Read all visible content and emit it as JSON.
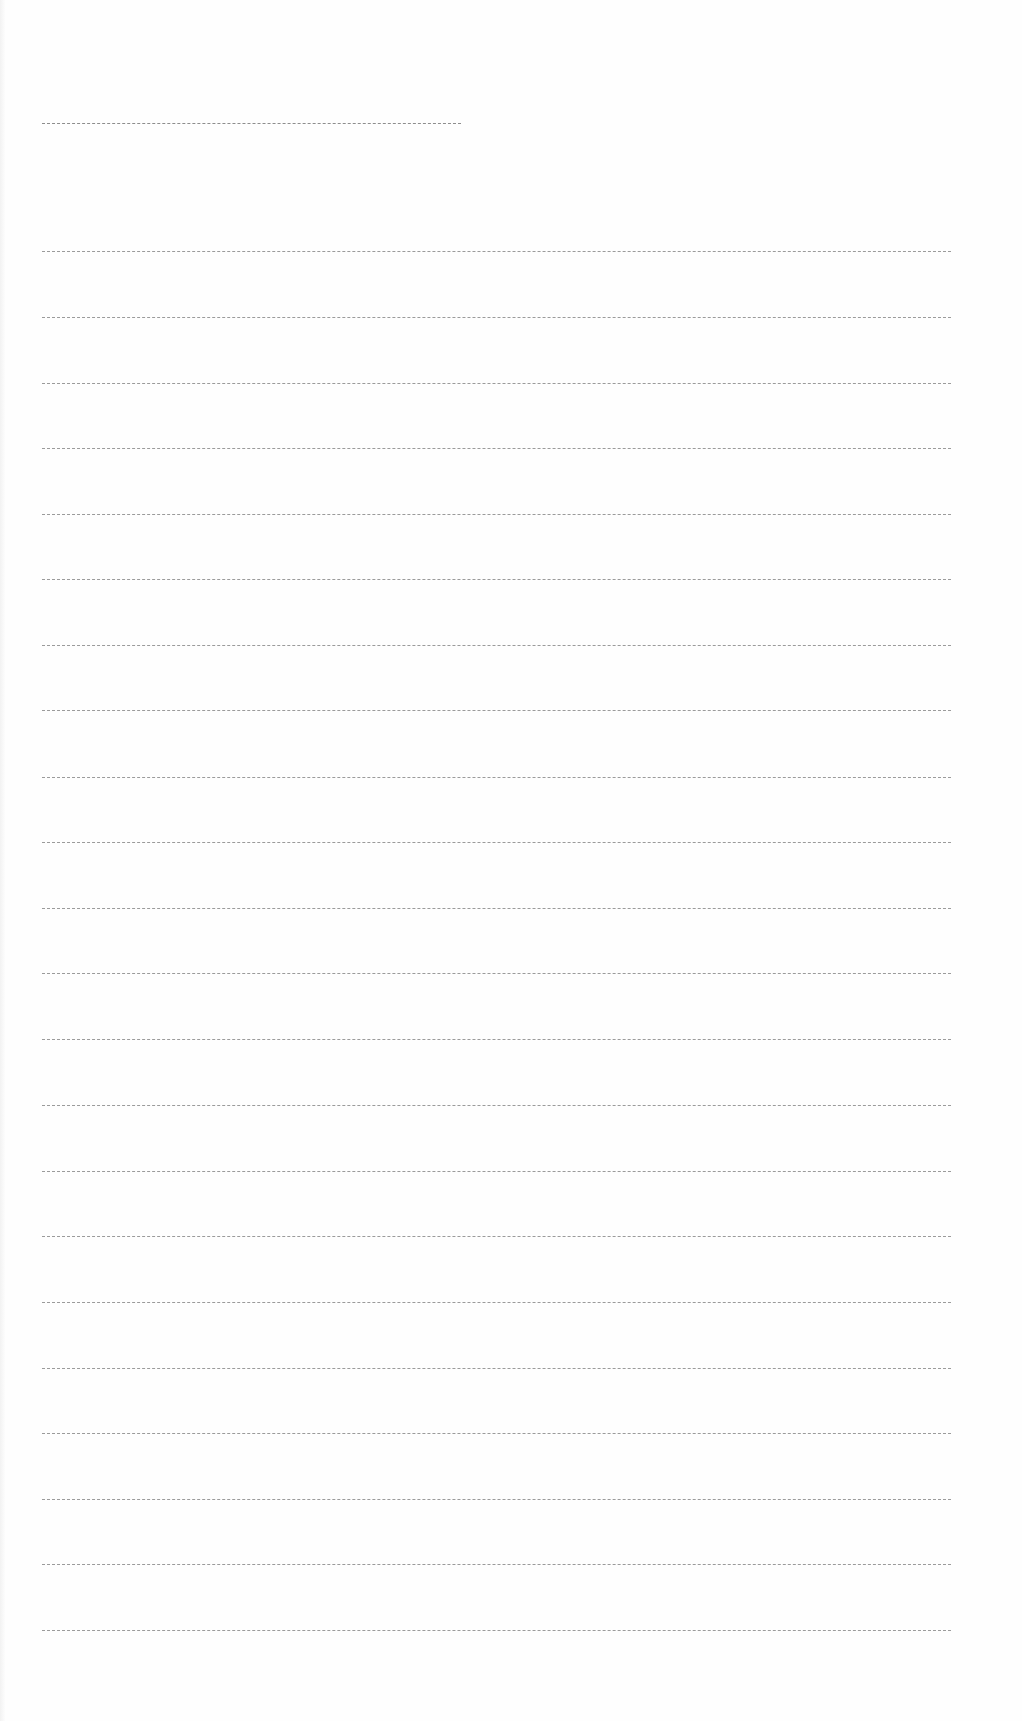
{
  "page": {
    "type": "blank lined writing sheet",
    "background": "#fefefe",
    "rule_color": "#8a8a8a",
    "title_line": {
      "y": 123,
      "x_start": 42,
      "x_end": 461
    },
    "ruled_lines": {
      "x_start": 42,
      "x_end": 951,
      "y_positions": [
        251,
        317,
        383,
        448,
        514,
        579,
        645,
        710,
        777,
        842,
        908,
        973,
        1039,
        1105,
        1171,
        1236,
        1302,
        1368,
        1433,
        1499,
        1564,
        1630
      ]
    }
  }
}
